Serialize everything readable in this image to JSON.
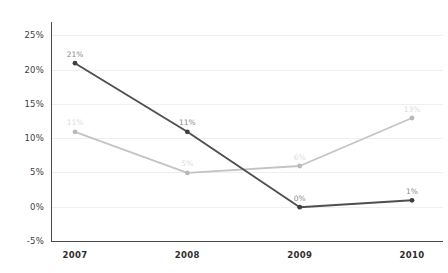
{
  "chart_data": {
    "type": "line",
    "title": "",
    "subtitle": "",
    "xlabel": "",
    "ylabel": "",
    "categories": [
      "2007",
      "2008",
      "2009",
      "2010"
    ],
    "ylim": [
      -5,
      27
    ],
    "ytick_values": [
      25,
      20,
      15,
      10,
      5,
      0,
      -5
    ],
    "ytick_labels": [
      "25%",
      "20%",
      "15%",
      "10%",
      "5%",
      "0%",
      "-5%"
    ],
    "grid": true,
    "grid_axis": "y",
    "legend": false,
    "legend_position": "none",
    "series": [
      {
        "name": "series-dark",
        "color": "#4f4f4f",
        "label_color": "#8a8a8a",
        "values": [
          21,
          11,
          0,
          1
        ],
        "point_labels": [
          "21%",
          "11%",
          "0%",
          "1%"
        ]
      },
      {
        "name": "series-light",
        "color": "#c4c4c4",
        "label_color": "#dcdcdc",
        "values": [
          11,
          5,
          6,
          13
        ],
        "point_labels": [
          "11%",
          "5%",
          "6%",
          "13%"
        ]
      }
    ]
  },
  "axes": {
    "y_ticks": [
      {
        "label": "25%",
        "value": 25
      },
      {
        "label": "20%",
        "value": 20
      },
      {
        "label": "15%",
        "value": 15
      },
      {
        "label": "10%",
        "value": 10
      },
      {
        "label": "5%",
        "value": 5
      },
      {
        "label": "0%",
        "value": 0
      },
      {
        "label": "-5%",
        "value": -5
      }
    ],
    "x_ticks": [
      {
        "label": "2007"
      },
      {
        "label": "2008"
      },
      {
        "label": "2009"
      },
      {
        "label": "2010"
      }
    ]
  },
  "colors": {
    "background": "#ffffff",
    "grid": "#f0eff0",
    "spine": "#4a4a4a",
    "series_dark": "#4f4f4f",
    "series_light": "#c4c4c4",
    "tick_text": "#3d3d3d"
  }
}
